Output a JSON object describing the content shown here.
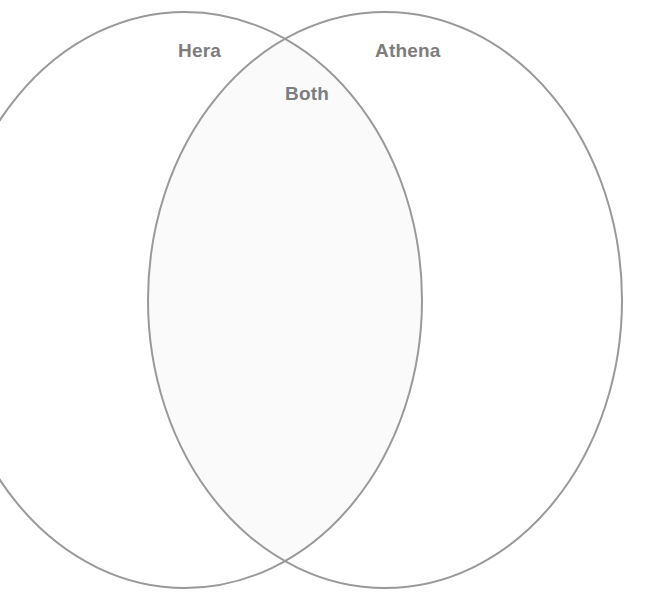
{
  "diagram": {
    "type": "venn",
    "sets": 2,
    "background_color": "#ffffff",
    "stroke_color": "#999999",
    "stroke_width": 2,
    "overlap_fill_color": "#fafafa",
    "label_color": "#7d7d7d",
    "labels": {
      "left": "Hera",
      "right": "Athena",
      "overlap": "Both"
    },
    "geometry": {
      "left_ellipse": {
        "cx": 185,
        "cy": 300,
        "rx": 237,
        "ry": 288
      },
      "right_ellipse": {
        "cx": 385,
        "cy": 300,
        "rx": 237,
        "ry": 288
      },
      "crossing_top": {
        "x": 307,
        "y": 57
      },
      "crossing_bottom": {
        "x": 307,
        "y": 551
      }
    },
    "entries": {
      "left_only": [],
      "right_only": [],
      "overlap": []
    }
  }
}
